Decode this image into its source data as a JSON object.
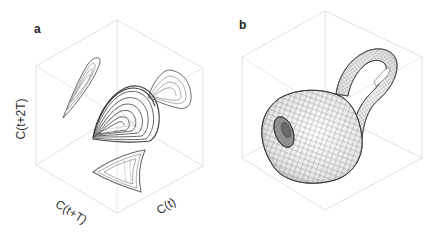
{
  "figure": {
    "panels": [
      {
        "id": "a",
        "letter": "a",
        "description": "Delay-embedded attractor with projections on cube faces",
        "axes": {
          "vertical": "C(t+2T)",
          "left": "C(t+T)",
          "right": "C(t)"
        }
      },
      {
        "id": "b",
        "letter": "b",
        "description": "Klein-bottle-like wireframe surface inside cube"
      }
    ],
    "colors": {
      "cube_edge": "#d6d6d6",
      "trajectory": "#555555",
      "projection": "#8a8a8a",
      "mesh": "#4a4a4a"
    }
  }
}
